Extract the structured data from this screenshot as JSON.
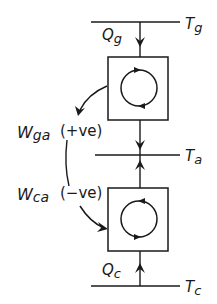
{
  "diagram": {
    "type": "thermodynamic-heat-pump-engine-schematic",
    "reservoirs": {
      "top": {
        "label_main": "T",
        "label_sub": "g"
      },
      "middle": {
        "label_main": "T",
        "label_sub": "a"
      },
      "bottom": {
        "label_main": "T",
        "label_sub": "c"
      }
    },
    "heat_flows": {
      "top": {
        "label_main": "Q",
        "label_sub": "g",
        "direction": "down"
      },
      "bottom": {
        "label_main": "Q",
        "label_sub": "c",
        "direction": "up"
      }
    },
    "work": {
      "upper": {
        "label_main": "W",
        "label_sub": "ga",
        "sign": "(+ve)"
      },
      "lower": {
        "label_main": "W",
        "label_sub": "ca",
        "sign": "(−ve)"
      }
    },
    "cycles": {
      "upper": {
        "rotation": "clockwise"
      },
      "lower": {
        "rotation": "counterclockwise"
      }
    },
    "colors": {
      "ink": "#1a1a1a",
      "background": "#ffffff"
    }
  }
}
